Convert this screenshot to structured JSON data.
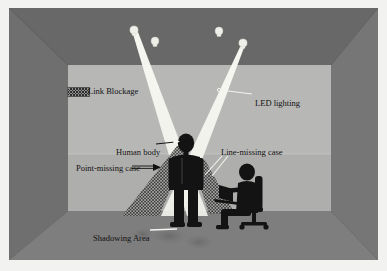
{
  "figure": {
    "type": "schematic-illustration"
  },
  "legend": {
    "link_blockage": {
      "label": "Link Blockage",
      "swatch": "hatched-pattern",
      "swatch_color": "#8e8e8e",
      "hatch_color": "#2e2e2e"
    }
  },
  "annotations": [
    {
      "id": "led-lighting",
      "label": "LED lighting",
      "leader": "line"
    },
    {
      "id": "human-body",
      "label": "Human body",
      "leader": "arrow"
    },
    {
      "id": "line-missing",
      "label": "Line-missing case",
      "leader": "two-lines"
    },
    {
      "id": "point-missing",
      "label": "Point-missing case",
      "leader": "arrow"
    },
    {
      "id": "shadowing-area",
      "label": "Shadowing Area",
      "leader": "line"
    }
  ],
  "labels": {
    "link_blockage": "Link Blockage",
    "led_lighting": "LED lighting",
    "human_body": "Human body",
    "line_missing_case": "Line-missing case",
    "point_missing_case": "Point-missing case",
    "shadowing_area": "Shadowing Area"
  },
  "scene": {
    "room": {
      "ceiling_color": "#6a6a6a",
      "left_wall_color": "#6e6e6e",
      "right_wall_color": "#757575",
      "back_wall_color": "#b6b6b4",
      "back_wall_lower_color": "#a9a9a7",
      "floor_color": "#7e7e7e"
    },
    "lamps": [
      {
        "id": "lamp-1",
        "x": 134,
        "y": 30,
        "emitting": true
      },
      {
        "id": "lamp-2",
        "x": 155,
        "y": 41,
        "emitting": false
      },
      {
        "id": "lamp-3",
        "x": 219,
        "y": 31,
        "emitting": false
      },
      {
        "id": "lamp-4",
        "x": 244,
        "y": 43,
        "emitting": true
      }
    ],
    "light_beams": [
      {
        "id": "beam-left",
        "from_lamp": "lamp-1",
        "color": "#f5f5f0"
      },
      {
        "id": "beam-right",
        "from_lamp": "lamp-4",
        "color": "#f5f5f0"
      }
    ],
    "figures": [
      {
        "id": "standing-person",
        "kind": "human-body-silhouette",
        "color": "#141414"
      },
      {
        "id": "seated-person",
        "kind": "person-at-desk-silhouette",
        "color": "#141414"
      },
      {
        "id": "office-chair",
        "kind": "office-chair-silhouette",
        "color": "#141414"
      },
      {
        "id": "laptop",
        "kind": "laptop-silhouette",
        "color": "#141414"
      }
    ],
    "blockage_regions": [
      {
        "id": "point-missing-region",
        "pattern": "cross-hatch"
      },
      {
        "id": "line-missing-region",
        "pattern": "cross-hatch"
      }
    ],
    "shadow_blobs": [
      {
        "id": "shadow-blob-1"
      },
      {
        "id": "shadow-blob-2"
      },
      {
        "id": "shadow-blob-3"
      }
    ]
  }
}
